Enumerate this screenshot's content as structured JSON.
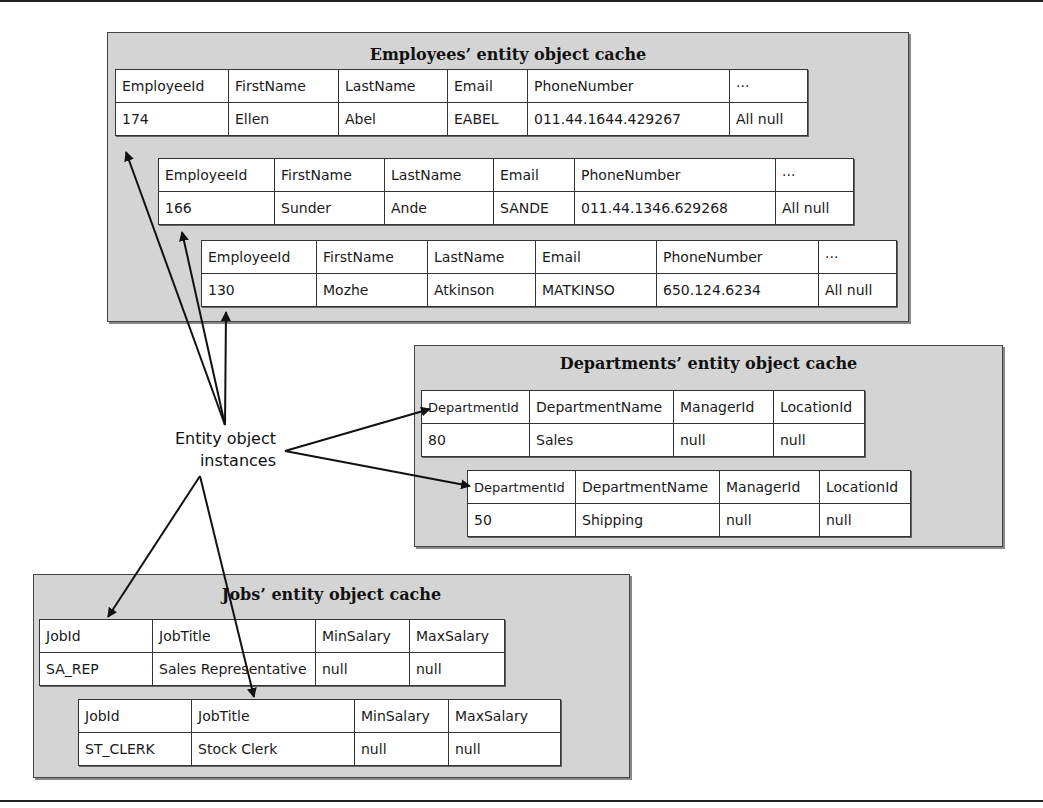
{
  "label": {
    "line1": "Entity object",
    "line2": "instances"
  },
  "employees": {
    "title": "Employees’ entity object cache",
    "headers": [
      "EmployeeId",
      "FirstName",
      "LastName",
      "Email",
      "PhoneNumber",
      "···"
    ],
    "rows": [
      [
        "174",
        "Ellen",
        "Abel",
        "EABEL",
        "011.44.1644.429267",
        "All null"
      ],
      [
        "166",
        "Sunder",
        "Ande",
        "SANDE",
        "011.44.1346.629268",
        "All null"
      ],
      [
        "130",
        "Mozhe",
        "Atkinson",
        "MATKINSO",
        "650.124.6234",
        "All null"
      ]
    ]
  },
  "departments": {
    "title": "Departments’ entity object cache",
    "headers": [
      "DepartmentId",
      "DepartmentName",
      "ManagerId",
      "LocationId"
    ],
    "rows": [
      [
        "80",
        "Sales",
        "null",
        "null"
      ],
      [
        "50",
        "Shipping",
        "null",
        "null"
      ]
    ]
  },
  "jobs": {
    "title": "Jobs’ entity object cache",
    "headers": [
      "JobId",
      "JobTitle",
      "MinSalary",
      "MaxSalary"
    ],
    "rows": [
      [
        "SA_REP",
        "Sales Representative",
        "null",
        "null"
      ],
      [
        "ST_CLERK",
        "Stock Clerk",
        "null",
        "null"
      ]
    ]
  },
  "colors": {
    "cache_bg": "#d4d4d4",
    "border": "#333333",
    "arrow": "#111111"
  }
}
